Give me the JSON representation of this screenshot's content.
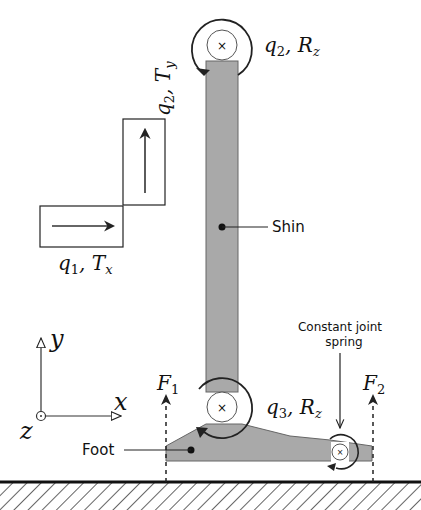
{
  "diagram": {
    "colors": {
      "body_fill": "#a9a9a9",
      "body_stroke": "#555555",
      "line": "#222222",
      "background": "#ffffff"
    },
    "labels": {
      "q1": "q",
      "q1_sub": "1",
      "q1_rest": ", T",
      "q1_rest_sub": "x",
      "q2_slider": "q",
      "q2_slider_sub": "2",
      "q2_slider_rest": ", T",
      "q2_slider_rest_sub": "y",
      "q2_rot": "q",
      "q2_rot_sub": "2",
      "q2_rot_rest": ", R",
      "q2_rot_rest_sub": "z",
      "q3_rot": "q",
      "q3_rot_sub": "3",
      "q3_rot_rest": ", R",
      "q3_rot_rest_sub": "z",
      "shin": "Shin",
      "foot": "Foot",
      "spring_line1": "Constant joint",
      "spring_line2": "spring",
      "F1": "F",
      "F1_sub": "1",
      "F2": "F",
      "F2_sub": "2",
      "axis_x": "x",
      "axis_y": "y",
      "axis_z": "z"
    },
    "components": [
      "prismatic joint x",
      "prismatic joint y",
      "hip revolute joint",
      "shin link",
      "ankle revolute joint",
      "foot link",
      "toe spring joint",
      "ground",
      "contact forces F1 F2",
      "coordinate frame"
    ]
  }
}
